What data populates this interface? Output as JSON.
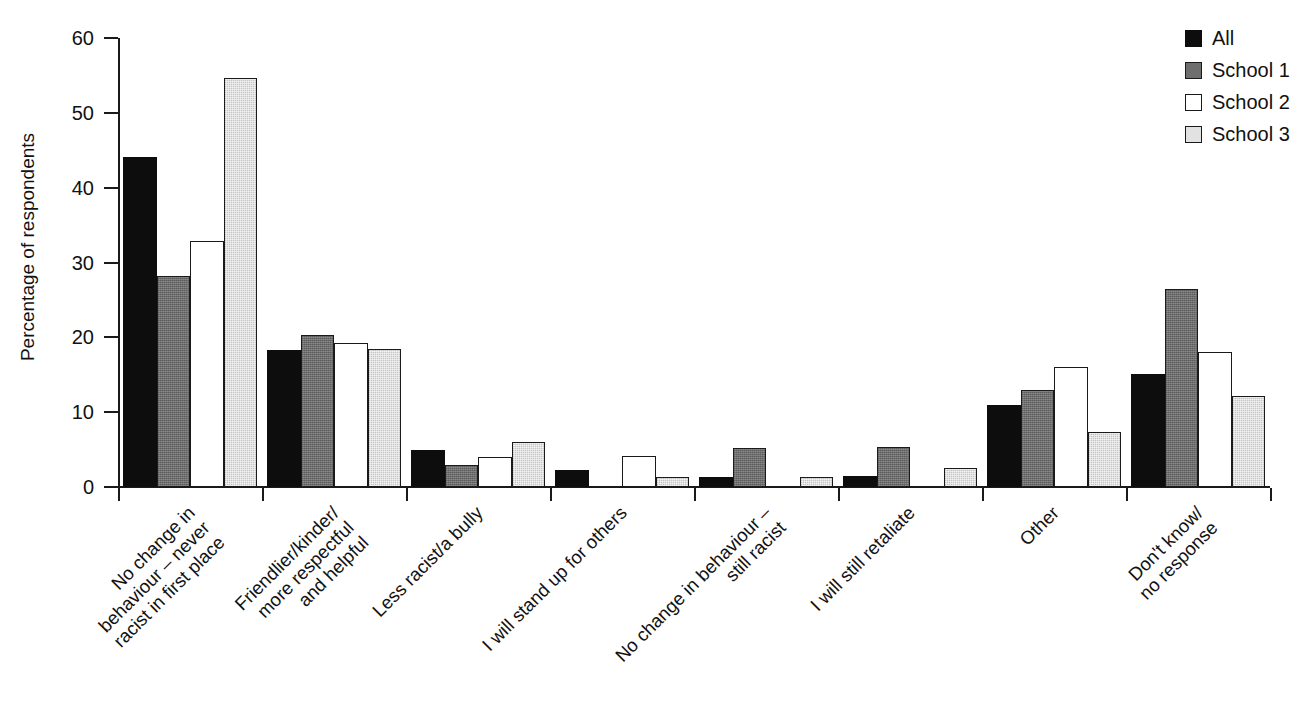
{
  "figure": {
    "cut_off_title_fragment": "",
    "background": "#ffffff"
  },
  "axes": {
    "y_title": "Percentage of respondents",
    "y_ticks": [
      "60",
      "50",
      "40",
      "30",
      "20",
      "10",
      "0"
    ],
    "x_title": ""
  },
  "legend": {
    "position": "top-right",
    "entries": [
      {
        "label": "All",
        "color": "#0d0d0d"
      },
      {
        "label": "School 1",
        "color": "#6e6e6e"
      },
      {
        "label": "School 2",
        "color": "#ffffff"
      },
      {
        "label": "School 3",
        "color": "#e2e2e2"
      }
    ]
  },
  "chart_data": {
    "type": "bar",
    "title": "",
    "xlabel": "",
    "ylabel": "Percentage of respondents",
    "ylim": [
      0,
      60
    ],
    "ytick_step": 10,
    "grid": false,
    "legend_position": "top-right",
    "categories": [
      "No change in behaviour – never racist in first place",
      "Friendlier/kinder/more respectful and helpful",
      "Less racist/a bully",
      "I will stand up for others",
      "No change in behaviour – still racist",
      "I will still retaliate",
      "Other",
      "Don't know/no response"
    ],
    "category_lines": [
      [
        "No change in",
        "behaviour – never",
        "racist in first place"
      ],
      [
        "Friendlier/kinder/",
        "more respectful",
        "and helpful"
      ],
      [
        "Less racist/a bully"
      ],
      [
        "I will stand up for others"
      ],
      [
        "No change in behaviour –",
        "still racist"
      ],
      [
        "I will still retaliate"
      ],
      [
        "Other"
      ],
      [
        "Don't know/",
        "no response"
      ]
    ],
    "series": [
      {
        "name": "All",
        "color": "#0d0d0d",
        "values": [
          44.1,
          18.3,
          4.9,
          2.3,
          1.3,
          1.5,
          11.0,
          15.1
        ]
      },
      {
        "name": "School 1",
        "color": "#6e6e6e",
        "values": [
          28.2,
          20.3,
          3.0,
          0.0,
          5.2,
          5.3,
          13.0,
          26.5
        ]
      },
      {
        "name": "School 2",
        "color": "#ffffff",
        "values": [
          32.9,
          19.3,
          4.0,
          4.2,
          0.0,
          0.0,
          16.0,
          18.1
        ]
      },
      {
        "name": "School 3",
        "color": "#e2e2e2",
        "values": [
          54.7,
          18.4,
          6.0,
          1.3,
          1.4,
          2.5,
          7.3,
          12.2
        ]
      }
    ]
  }
}
